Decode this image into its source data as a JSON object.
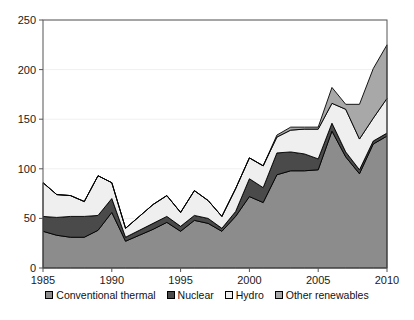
{
  "chart_data": {
    "type": "area",
    "stacked": true,
    "title": "",
    "subtitle": "",
    "xlabel": "",
    "ylabel": "",
    "xlim": [
      1985,
      2010
    ],
    "ylim": [
      0,
      250
    ],
    "grid": true,
    "grid_axis": "y",
    "legend_position": "bottom",
    "x": [
      1985,
      1986,
      1987,
      1988,
      1989,
      1990,
      1991,
      1992,
      1993,
      1994,
      1995,
      1996,
      1997,
      1998,
      1999,
      2000,
      2001,
      2002,
      2003,
      2004,
      2005,
      2006,
      2007,
      2008,
      2009,
      2010
    ],
    "xticks": [
      1985,
      1990,
      1995,
      2000,
      2005,
      2010
    ],
    "xtick_labels": [
      "1985",
      "1990",
      "1995",
      "2000",
      "2005",
      "2010"
    ],
    "yticks": [
      0,
      50,
      100,
      150,
      200,
      250
    ],
    "ytick_labels": [
      "0",
      "50",
      "100",
      "150",
      "200",
      "250"
    ],
    "series": [
      {
        "name": "Conventional thermal",
        "color": "#8c8c8c",
        "values": [
          37,
          33,
          31,
          31,
          38,
          56,
          27,
          33,
          39,
          46,
          37,
          48,
          45,
          37,
          52,
          72,
          66,
          94,
          98,
          98,
          99,
          138,
          112,
          95,
          125,
          133
        ]
      },
      {
        "name": "Nuclear",
        "color": "#4a4a4a",
        "values": [
          15,
          18,
          21,
          21,
          15,
          14,
          4,
          5,
          6,
          6,
          5,
          5,
          5,
          3,
          5,
          18,
          15,
          22,
          19,
          17,
          11,
          8,
          5,
          4,
          3,
          3
        ]
      },
      {
        "name": "Hydro",
        "color": "#efefef",
        "values": [
          34,
          23,
          21,
          15,
          40,
          16,
          9,
          14,
          19,
          21,
          14,
          25,
          18,
          12,
          23,
          21,
          22,
          16,
          22,
          25,
          30,
          20,
          43,
          31,
          23,
          35
        ]
      },
      {
        "name": "Other renewables",
        "color": "#a8a8a8",
        "values": [
          0,
          0,
          0,
          0,
          0,
          0,
          0,
          0,
          0,
          0,
          0,
          0,
          0,
          0,
          0,
          0,
          0,
          2,
          3,
          2,
          2,
          16,
          5,
          35,
          50,
          54
        ]
      }
    ],
    "totals": [
      86,
      74,
      73,
      67,
      93,
      86,
      40,
      52,
      64,
      73,
      56,
      78,
      68,
      52,
      80,
      111,
      103,
      134,
      142,
      142,
      142,
      182,
      165,
      165,
      201,
      225
    ]
  },
  "legend": {
    "items": [
      {
        "label": "Conventional thermal",
        "color": "#8c8c8c"
      },
      {
        "label": "Nuclear",
        "color": "#4a4a4a"
      },
      {
        "label": "Hydro",
        "color": "#efefef"
      },
      {
        "label": "Other renewables",
        "color": "#a8a8a8"
      }
    ]
  },
  "axes": {
    "axis_color": "#555555",
    "grid_color": "#f0f0f0",
    "outline_color": "#000000"
  }
}
